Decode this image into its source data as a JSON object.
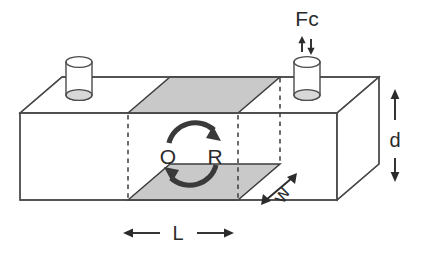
{
  "figure": {
    "kind": "3d-beam-shear-diagram",
    "background_color": "#ffffff",
    "line_color": "#4a4a4a",
    "shaded_face_color": "#c9c9c9",
    "text_color": "#2b2b2b"
  },
  "labels": {
    "force": "Fc",
    "force_arrows": "↑↓",
    "rotation_left": "O",
    "rotation_right": "R",
    "length": "L",
    "depth": "d",
    "width": "w"
  },
  "annotations": {
    "force_label": "Fc",
    "force_direction_glyph": "up-down-arrows",
    "rotation_symbol": "circular-double-arrow",
    "dimension_length": "L",
    "dimension_depth": "d",
    "dimension_width": "w"
  },
  "components": [
    {
      "name": "beam-body",
      "type": "rectangular-block",
      "shading": "white"
    },
    {
      "name": "left-cylinder",
      "type": "cylinder",
      "position": "top-left"
    },
    {
      "name": "right-cylinder",
      "type": "cylinder",
      "position": "top-right",
      "loaded_by": "Fc"
    },
    {
      "name": "top-shear-zone",
      "type": "parallelogram",
      "shading": "gray"
    },
    {
      "name": "bottom-shear-zone",
      "type": "parallelogram",
      "shading": "gray"
    },
    {
      "name": "shear-boundary-lines",
      "type": "dashed-vertical",
      "count": 3
    }
  ],
  "dimensions": [
    {
      "symbol": "L",
      "axis": "horizontal",
      "location": "bottom",
      "describes": "shear-zone-length"
    },
    {
      "symbol": "d",
      "axis": "vertical",
      "location": "right",
      "describes": "beam-depth"
    },
    {
      "symbol": "w",
      "axis": "diagonal",
      "location": "front-right",
      "describes": "beam-width"
    }
  ]
}
